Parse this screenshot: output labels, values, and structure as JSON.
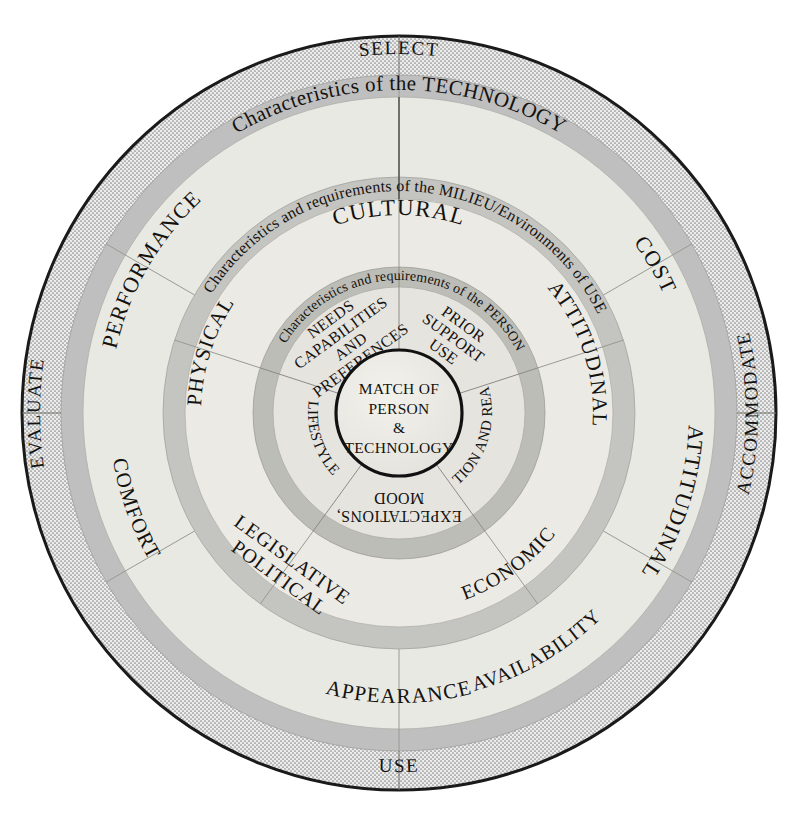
{
  "diagram": {
    "type": "concentric-ring-diagram",
    "center": {
      "lines": [
        "MATCH OF",
        "PERSON",
        "&",
        "TECHNOLOGY"
      ]
    },
    "rings": [
      {
        "id": "person",
        "band_label": "Characteristics and requirements of the PERSON",
        "segments": [
          {
            "label": "NEEDS CAPABILITIES AND PREFERENCES",
            "lines": [
              "NEEDS",
              "CAPABILITIES",
              "AND",
              "PREFERENCES"
            ]
          },
          {
            "label": "PRIOR SUPPORT USE",
            "lines": [
              "PRIOR",
              "SUPPORT",
              "USE"
            ]
          },
          {
            "label": "MOTIVATION AND READINESS",
            "lines": [
              "MOTIVATION",
              "AND READINESS"
            ]
          },
          {
            "label": "EXPECTATIONS, MOOD",
            "lines": [
              "EXPECTATIONS,",
              "MOOD"
            ]
          },
          {
            "label": "LIFESTYLE",
            "lines": [
              "LIFESTYLE"
            ]
          }
        ]
      },
      {
        "id": "milieu",
        "band_label": "Characteristics and requirements of the MILIEU/Environments of USE",
        "segments": [
          {
            "label": "CULTURAL",
            "lines": [
              "CULTURAL"
            ]
          },
          {
            "label": "ATTITUDINAL",
            "lines": [
              "ATTITUDINAL"
            ]
          },
          {
            "label": "ECONOMIC",
            "lines": [
              "ECONOMIC"
            ]
          },
          {
            "label": "LEGISLATIVE POLITICAL",
            "lines": [
              "LEGISLATIVE",
              "POLITICAL"
            ]
          },
          {
            "label": "PHYSICAL",
            "lines": [
              "PHYSICAL"
            ]
          }
        ]
      },
      {
        "id": "technology",
        "band_label": "Characteristics of the TECHNOLOGY",
        "segments": [
          {
            "label": "PERFORMANCE",
            "lines": [
              "PERFORMANCE"
            ]
          },
          {
            "label": "COST",
            "lines": [
              "COST"
            ]
          },
          {
            "label": "ATTITUDINAL",
            "lines": [
              "ATTITUDINAL"
            ]
          },
          {
            "label": "AVAILABILITY",
            "lines": [
              "AVAILABILITY"
            ]
          },
          {
            "label": "APPEARANCE",
            "lines": [
              "APPEARANCE"
            ]
          },
          {
            "label": "COMFORT",
            "lines": [
              "COMFORT"
            ]
          }
        ]
      },
      {
        "id": "process",
        "band_label": "",
        "segments": [
          {
            "label": "SELECT",
            "lines": [
              "SELECT"
            ]
          },
          {
            "label": "ACCOMMODATE",
            "lines": [
              "ACCOMMODATE"
            ]
          },
          {
            "label": "USE",
            "lines": [
              "USE"
            ]
          },
          {
            "label": "EVALUATE",
            "lines": [
              "EVALUATE"
            ]
          }
        ]
      }
    ],
    "colors": {
      "outer_stroke": "#1a1a1a",
      "process_band": "#dcdcdc",
      "tech_band_gray": "#bfbfbf",
      "tech_ring_fill": "#e9e9e4",
      "milieu_band_gray": "#c4c4c0",
      "milieu_ring_fill": "#eceae5",
      "person_band_gray": "#bdbdb8",
      "person_ring_fill": "#e6e4df",
      "core_fill": "#e8e6e1",
      "divider": "#8d8d88",
      "text": "#14120f"
    }
  }
}
